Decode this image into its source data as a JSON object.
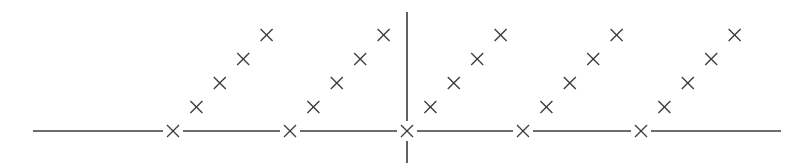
{
  "diagram": {
    "stroke_color": "#3a3a3a",
    "axis": {
      "horizontal": {
        "y": 131,
        "x_start": 33,
        "x_end": 781
      },
      "vertical": {
        "x": 407,
        "y_start": 12,
        "y_end": 163
      }
    },
    "baseline_crosses_x": [
      173,
      290,
      407,
      523,
      641
    ],
    "diagonal_step": {
      "dx": 23.4,
      "dy": -24
    },
    "diagonal_count": 4,
    "cross_half_size": 6
  }
}
